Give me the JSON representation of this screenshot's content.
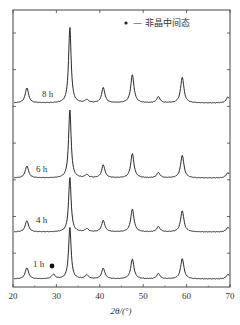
{
  "chart_data": {
    "type": "line",
    "title": "",
    "xlabel": "2θ/(°)",
    "ylabel": "",
    "xlim": [
      20,
      70
    ],
    "x_ticks": [
      20,
      30,
      40,
      50,
      60,
      70
    ],
    "x_tick_labels": [
      "20",
      "30",
      "40",
      "50",
      "60",
      "70"
    ],
    "grid": false,
    "legend": {
      "position": "top-right",
      "entries": [
        {
          "marker": "●",
          "label": "— 非晶中间态"
        }
      ]
    },
    "annotations": [
      {
        "text": "●",
        "x": 29.3,
        "series": "1 h",
        "meaning": "amorphous intermediate phase peak"
      }
    ],
    "peak_positions_2theta": [
      23.2,
      29.3,
      33.1,
      37.0,
      40.8,
      47.5,
      53.5,
      59.0,
      69.5
    ],
    "series": [
      {
        "name": "8 h",
        "offset": 3,
        "peaks": [
          {
            "x": 23.2,
            "h": 0.2
          },
          {
            "x": 33.1,
            "h": 1.0
          },
          {
            "x": 37.0,
            "h": 0.04
          },
          {
            "x": 40.8,
            "h": 0.2
          },
          {
            "x": 47.5,
            "h": 0.37
          },
          {
            "x": 53.5,
            "h": 0.08
          },
          {
            "x": 59.0,
            "h": 0.34
          },
          {
            "x": 69.5,
            "h": 0.08
          }
        ]
      },
      {
        "name": "6 h",
        "offset": 2,
        "peaks": [
          {
            "x": 23.2,
            "h": 0.16
          },
          {
            "x": 33.1,
            "h": 0.9
          },
          {
            "x": 37.0,
            "h": 0.04
          },
          {
            "x": 40.8,
            "h": 0.17
          },
          {
            "x": 47.5,
            "h": 0.32
          },
          {
            "x": 53.5,
            "h": 0.07
          },
          {
            "x": 59.0,
            "h": 0.3
          },
          {
            "x": 69.5,
            "h": 0.07
          }
        ]
      },
      {
        "name": "4 h",
        "offset": 1,
        "peaks": [
          {
            "x": 23.2,
            "h": 0.15
          },
          {
            "x": 33.1,
            "h": 0.72
          },
          {
            "x": 37.0,
            "h": 0.04
          },
          {
            "x": 40.8,
            "h": 0.15
          },
          {
            "x": 47.5,
            "h": 0.3
          },
          {
            "x": 53.5,
            "h": 0.07
          },
          {
            "x": 59.0,
            "h": 0.28
          },
          {
            "x": 69.5,
            "h": 0.06
          }
        ]
      },
      {
        "name": "1 h",
        "offset": 0,
        "peaks": [
          {
            "x": 23.2,
            "h": 0.15
          },
          {
            "x": 29.3,
            "h": 0.06
          },
          {
            "x": 33.1,
            "h": 0.68
          },
          {
            "x": 37.0,
            "h": 0.05
          },
          {
            "x": 40.8,
            "h": 0.14
          },
          {
            "x": 47.5,
            "h": 0.26
          },
          {
            "x": 53.5,
            "h": 0.07
          },
          {
            "x": 59.0,
            "h": 0.27
          },
          {
            "x": 69.5,
            "h": 0.06
          }
        ]
      }
    ]
  },
  "layout": {
    "plot": {
      "left": 13,
      "right": 230,
      "top": 10,
      "bottom": 287
    },
    "baselines": {
      "8 h": 103,
      "6 h": 178,
      "4 h": 232,
      "1 h": 279
    },
    "label_pos": {
      "8 h": [
        42,
        97
      ],
      "6 h": [
        36,
        172
      ],
      "4 h": [
        36,
        223
      ],
      "1 h": [
        33,
        267
      ]
    },
    "peak_px_per_unit": 76,
    "line_color": "#2a2a2a"
  }
}
